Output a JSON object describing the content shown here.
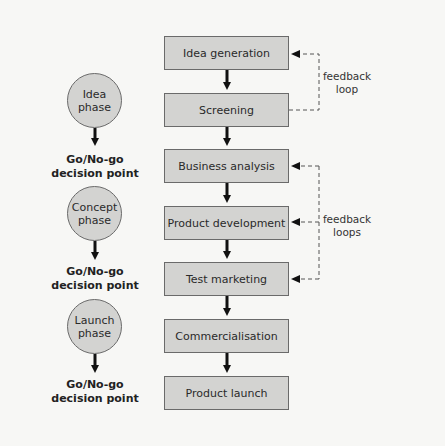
{
  "diagram": {
    "title": "",
    "stages": [
      {
        "label": "Idea generation"
      },
      {
        "label": "Screening"
      },
      {
        "label": "Business analysis"
      },
      {
        "label": "Product development"
      },
      {
        "label": "Test marketing"
      },
      {
        "label": "Commercialisation"
      },
      {
        "label": "Product launch"
      }
    ],
    "phases": [
      {
        "line1": "Idea",
        "line2": "phase"
      },
      {
        "line1": "Concept",
        "line2": "phase"
      },
      {
        "line1": "Launch",
        "line2": "phase"
      }
    ],
    "decision_points": [
      {
        "line1": "Go/No-go",
        "line2": "decision point"
      },
      {
        "line1": "Go/No-go",
        "line2": "decision point"
      },
      {
        "line1": "Go/No-go",
        "line2": "decision point"
      }
    ],
    "feedback": [
      {
        "line1": "feedback",
        "line2": "loop",
        "from": "Screening",
        "to": [
          "Idea generation"
        ]
      },
      {
        "line1": "feedback",
        "line2": "loops",
        "from": "Test marketing",
        "to": [
          "Business analysis",
          "Product development",
          "Test marketing"
        ]
      }
    ],
    "colors": {
      "background": "#f7f7f5",
      "box_fill": "#d3d3d1",
      "box_border": "#6a6a6a",
      "arrow": "#111111",
      "dashed": "#555555"
    }
  }
}
